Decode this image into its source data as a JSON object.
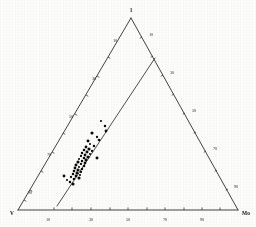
{
  "figure": {
    "name": "ternary-diagram",
    "background_color": "#fdfdfc",
    "line_color": "#222222",
    "point_color": "#0d0d0d"
  },
  "vertices": [
    {
      "id": "apex",
      "label": "1",
      "x": 131,
      "y": 18,
      "label_x": 131,
      "label_y": 10
    },
    {
      "id": "bottom-left",
      "label": "V",
      "x": 18,
      "y": 210,
      "label_x": 12,
      "label_y": 213
    },
    {
      "id": "bottom-right",
      "label": "Mo",
      "x": 238,
      "y": 210,
      "label_x": 246,
      "label_y": 213
    }
  ],
  "axes": {
    "bottom": {
      "name": "bottom-axis",
      "from": [
        18,
        210
      ],
      "to": [
        238,
        210
      ],
      "ticks": [
        {
          "label": "10",
          "x": 54,
          "y": 210,
          "label_x": 48,
          "label_y": 219
        },
        {
          "label": "",
          "x": 72,
          "y": 210,
          "label_x": 72,
          "label_y": 219
        },
        {
          "label": "30",
          "x": 91,
          "y": 210,
          "label_x": 91,
          "label_y": 219
        },
        {
          "label": "",
          "x": 110,
          "y": 210,
          "label_x": 110,
          "label_y": 219
        },
        {
          "label": "50",
          "x": 128,
          "y": 210,
          "label_x": 128,
          "label_y": 219
        },
        {
          "label": "",
          "x": 147,
          "y": 210,
          "label_x": 147,
          "label_y": 219
        },
        {
          "label": "70",
          "x": 165,
          "y": 210,
          "label_x": 165,
          "label_y": 219
        },
        {
          "label": "",
          "x": 184,
          "y": 210,
          "label_x": 184,
          "label_y": 219
        },
        {
          "label": "90",
          "x": 202,
          "y": 210,
          "label_x": 202,
          "label_y": 219
        },
        {
          "label": "",
          "x": 220,
          "y": 210,
          "label_x": 220,
          "label_y": 219
        }
      ]
    },
    "left": {
      "name": "left-axis",
      "from": [
        18,
        210
      ],
      "to": [
        131,
        18
      ],
      "ticks": [
        {
          "label": "10",
          "x": 108,
          "y": 57,
          "label_x": 115,
          "label_y": 40
        },
        {
          "label": "",
          "x": 97,
          "y": 76,
          "label_x": 97,
          "label_y": 76
        },
        {
          "label": "30",
          "x": 86,
          "y": 95,
          "label_x": 94,
          "label_y": 78
        },
        {
          "label": "",
          "x": 75,
          "y": 114,
          "label_x": 75,
          "label_y": 114
        },
        {
          "label": "50",
          "x": 63,
          "y": 133,
          "label_x": 71,
          "label_y": 116
        },
        {
          "label": "",
          "x": 52,
          "y": 152,
          "label_x": 52,
          "label_y": 152
        },
        {
          "label": "70",
          "x": 41,
          "y": 171,
          "label_x": 49,
          "label_y": 154
        },
        {
          "label": "",
          "x": 30,
          "y": 190,
          "label_x": 30,
          "label_y": 190
        },
        {
          "label": "90",
          "x": 24,
          "y": 200,
          "label_x": 30,
          "label_y": 192
        }
      ]
    },
    "right": {
      "name": "right-axis",
      "from": [
        131,
        18
      ],
      "to": [
        238,
        210
      ],
      "ticks": [
        {
          "label": "10",
          "x": 142,
          "y": 37,
          "label_x": 151,
          "label_y": 34
        },
        {
          "label": "",
          "x": 153,
          "y": 56,
          "label_x": 153,
          "label_y": 56
        },
        {
          "label": "30",
          "x": 163,
          "y": 75,
          "label_x": 172,
          "label_y": 72
        },
        {
          "label": "",
          "x": 174,
          "y": 94,
          "label_x": 174,
          "label_y": 94
        },
        {
          "label": "50",
          "x": 185,
          "y": 113,
          "label_x": 194,
          "label_y": 110
        },
        {
          "label": "",
          "x": 196,
          "y": 132,
          "label_x": 196,
          "label_y": 132
        },
        {
          "label": "70",
          "x": 206,
          "y": 151,
          "label_x": 215,
          "label_y": 148
        },
        {
          "label": "",
          "x": 217,
          "y": 170,
          "label_x": 217,
          "label_y": 170
        },
        {
          "label": "90",
          "x": 228,
          "y": 189,
          "label_x": 236,
          "label_y": 186
        }
      ]
    }
  },
  "internal_line": {
    "name": "internal-boundary-line",
    "from": [
      57,
      206
    ],
    "to": [
      155,
      58
    ]
  },
  "chart_data": {
    "type": "scatter",
    "title": "",
    "xlabel": "",
    "ylabel": "",
    "legend": [],
    "grid": false,
    "point_count": 46,
    "points_px": [
      [
        101,
        121
      ],
      [
        105,
        126
      ],
      [
        106,
        131
      ],
      [
        92,
        133
      ],
      [
        97,
        137
      ],
      [
        99,
        140
      ],
      [
        88,
        141
      ],
      [
        90,
        144
      ],
      [
        94,
        146
      ],
      [
        86,
        147
      ],
      [
        89,
        149
      ],
      [
        92,
        151
      ],
      [
        84,
        150
      ],
      [
        87,
        152
      ],
      [
        90,
        154
      ],
      [
        82,
        153
      ],
      [
        85,
        155
      ],
      [
        88,
        157
      ],
      [
        81,
        156
      ],
      [
        84,
        158
      ],
      [
        86,
        160
      ],
      [
        79,
        159
      ],
      [
        82,
        161
      ],
      [
        85,
        163
      ],
      [
        78,
        162
      ],
      [
        81,
        164
      ],
      [
        84,
        166
      ],
      [
        76,
        165
      ],
      [
        79,
        167
      ],
      [
        82,
        169
      ],
      [
        75,
        168
      ],
      [
        78,
        170
      ],
      [
        81,
        172
      ],
      [
        74,
        171
      ],
      [
        77,
        173
      ],
      [
        80,
        175
      ],
      [
        73,
        174
      ],
      [
        76,
        176
      ],
      [
        79,
        178
      ],
      [
        71,
        177
      ],
      [
        74,
        179
      ],
      [
        97,
        158
      ],
      [
        67,
        180
      ],
      [
        70,
        182
      ],
      [
        64,
        176
      ],
      [
        73,
        184
      ]
    ]
  }
}
